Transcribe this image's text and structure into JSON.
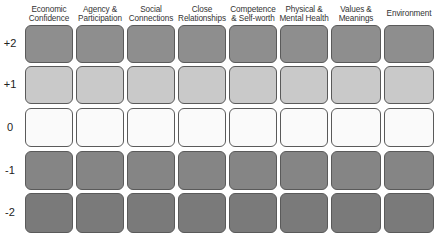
{
  "columns": [
    {
      "label": "Economic Confidence"
    },
    {
      "label": "Agency & Participation"
    },
    {
      "label": "Social Connections"
    },
    {
      "label": "Close Relationships"
    },
    {
      "label": "Competence & Self-worth"
    },
    {
      "label": "Physical & Mental Health"
    },
    {
      "label": "Values & Meanings"
    },
    {
      "label": "Environment"
    }
  ],
  "rows": [
    {
      "label": "+2",
      "color": "#8e8e8e"
    },
    {
      "label": "+1",
      "color": "#c9c9c9"
    },
    {
      "label": "0",
      "color": "#fafafa"
    },
    {
      "label": "-1",
      "color": "#858585"
    },
    {
      "label": "-2",
      "color": "#7a7a7a"
    }
  ]
}
